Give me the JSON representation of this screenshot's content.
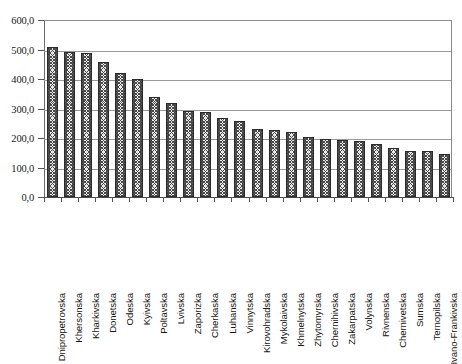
{
  "chart_data": {
    "type": "bar",
    "title": "",
    "subtitle": "",
    "xlabel": "",
    "ylabel": "",
    "ylim": [
      0,
      600
    ],
    "grid": true,
    "legend": "none",
    "decimal_separator": ",",
    "y_ticks": [
      "0,0",
      "100,0",
      "200,0",
      "300,0",
      "400,0",
      "500,0",
      "600,0"
    ],
    "y_tick_values": [
      0,
      100,
      200,
      300,
      400,
      500,
      600
    ],
    "categories": [
      "Dnipropetrovska",
      "Khersonska",
      "Kharkivska",
      "Donetska",
      "Odeska",
      "Kyivska",
      "Poltavska",
      "Lvivska",
      "Zaporizka",
      "Cherkaska",
      "Luhanska",
      "Vinnytska",
      "Kirovohradska",
      "Mykolaivska",
      "Khmelnytska",
      "Zhytomyrska",
      "Chernihivska",
      "Zakarpatska",
      "Volynska",
      "Rivnenska",
      "Chernivetska",
      "Sumska",
      "Ternopilska",
      "Ivano-Frankivska"
    ],
    "values": [
      510,
      492,
      488,
      458,
      420,
      400,
      340,
      320,
      292,
      288,
      268,
      258,
      232,
      228,
      222,
      205,
      198,
      193,
      190,
      180,
      165,
      157,
      157,
      147
    ]
  }
}
